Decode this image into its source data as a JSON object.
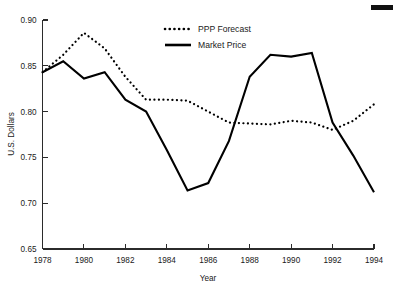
{
  "chart_data": {
    "type": "line",
    "title": "",
    "xlabel": "Year",
    "ylabel": "U.S. Dollars",
    "xlim": [
      1978,
      1994
    ],
    "ylim": [
      0.65,
      0.9
    ],
    "x_ticks": [
      1978,
      1980,
      1982,
      1984,
      1986,
      1988,
      1990,
      1992,
      1994
    ],
    "x_tick_labels": [
      "1978",
      "1980",
      "1982",
      "1984",
      "1986",
      "1988",
      "1990",
      "1992",
      "1994"
    ],
    "y_ticks": [
      0.65,
      0.7,
      0.75,
      0.8,
      0.85,
      0.9
    ],
    "y_tick_labels": [
      "0.65",
      "0.70",
      "0.75",
      "0.80",
      "0.85",
      "0.90"
    ],
    "grid": false,
    "legend_position": "top-center",
    "x": [
      1978,
      1979,
      1980,
      1981,
      1982,
      1983,
      1984,
      1985,
      1986,
      1987,
      1988,
      1989,
      1990,
      1991,
      1992,
      1993,
      1994
    ],
    "series": [
      {
        "name": "PPP Forecast",
        "style": "dotted",
        "color": "#000000",
        "values": [
          0.843,
          0.862,
          0.886,
          0.869,
          0.838,
          0.813,
          0.813,
          0.812,
          0.8,
          0.788,
          0.787,
          0.786,
          0.79,
          0.788,
          0.78,
          0.79,
          0.808
        ]
      },
      {
        "name": "Market Price",
        "style": "solid",
        "color": "#000000",
        "values": [
          0.843,
          0.855,
          0.836,
          0.843,
          0.813,
          0.8,
          0.758,
          0.714,
          0.722,
          0.768,
          0.838,
          0.862,
          0.86,
          0.864,
          0.788,
          0.752,
          0.712
        ]
      }
    ]
  },
  "legend": {
    "entries": [
      {
        "label": "PPP Forecast"
      },
      {
        "label": "Market Price"
      }
    ]
  },
  "marks": {
    "corner_mark": ""
  }
}
